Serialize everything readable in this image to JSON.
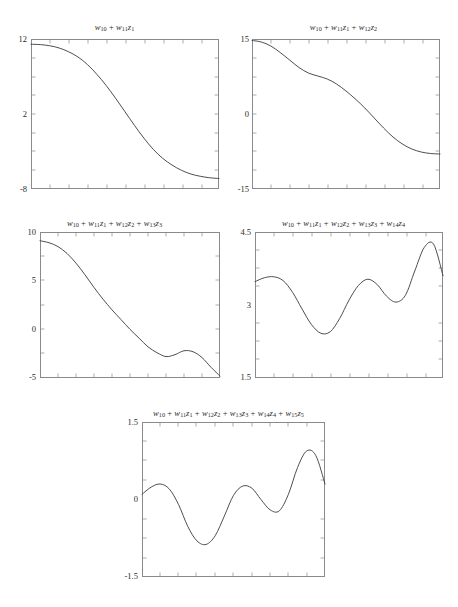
{
  "figure": {
    "background_color": "#ffffff",
    "line_color": "#3a3a3a",
    "axis_color": "#8a8a8a",
    "layout": "2-2-1 grid of line plots"
  },
  "chart_data": [
    {
      "type": "line",
      "id": "panel-1",
      "title": "w10 + w11z1",
      "title_parts": [
        {
          "sym": "w",
          "sub": "10"
        },
        {
          "op": "+"
        },
        {
          "sym": "w",
          "sub": "11"
        },
        {
          "sym": "z",
          "sub": "1"
        }
      ],
      "xlabel": "",
      "ylabel": "",
      "ylim": [
        -8,
        12
      ],
      "xlim": [
        0,
        1
      ],
      "yticks": [
        12,
        2,
        -8
      ],
      "ytick_labels": [
        "12",
        "2",
        "-8"
      ],
      "grid": false,
      "legend": "none",
      "x": [
        0.0,
        0.05,
        0.1,
        0.15,
        0.2,
        0.25,
        0.3,
        0.35,
        0.4,
        0.45,
        0.5,
        0.55,
        0.6,
        0.65,
        0.7,
        0.75,
        0.8,
        0.85,
        0.9,
        0.95,
        1.0
      ],
      "values": [
        11.3,
        11.25,
        11.1,
        10.8,
        10.3,
        9.6,
        8.6,
        7.3,
        5.8,
        4.1,
        2.3,
        0.5,
        -1.2,
        -2.7,
        -3.9,
        -4.8,
        -5.5,
        -6.0,
        -6.3,
        -6.5,
        -6.6
      ]
    },
    {
      "type": "line",
      "id": "panel-2",
      "title": "w10 + w11z1 + w12z2",
      "title_parts": [
        {
          "sym": "w",
          "sub": "10"
        },
        {
          "op": "+"
        },
        {
          "sym": "w",
          "sub": "11"
        },
        {
          "sym": "z",
          "sub": "1"
        },
        {
          "op": "+"
        },
        {
          "sym": "w",
          "sub": "12"
        },
        {
          "sym": "z",
          "sub": "2"
        }
      ],
      "xlabel": "",
      "ylabel": "",
      "ylim": [
        -15,
        15
      ],
      "xlim": [
        0,
        1
      ],
      "yticks": [
        15,
        0,
        -15
      ],
      "ytick_labels": [
        "15",
        "0",
        "-15"
      ],
      "grid": false,
      "legend": "none",
      "x": [
        0.0,
        0.05,
        0.1,
        0.15,
        0.2,
        0.25,
        0.3,
        0.35,
        0.4,
        0.45,
        0.5,
        0.55,
        0.6,
        0.65,
        0.7,
        0.75,
        0.8,
        0.85,
        0.9,
        0.95,
        1.0
      ],
      "values": [
        14.7,
        14.4,
        13.6,
        12.3,
        10.8,
        9.3,
        8.2,
        7.6,
        7.0,
        6.0,
        4.6,
        3.0,
        1.2,
        -0.8,
        -2.8,
        -4.6,
        -6.0,
        -7.0,
        -7.6,
        -7.9,
        -8.0
      ]
    },
    {
      "type": "line",
      "id": "panel-3",
      "title": "w10 + w11z1 + w12z2 + w13z3",
      "title_parts": [
        {
          "sym": "w",
          "sub": "10"
        },
        {
          "op": "+"
        },
        {
          "sym": "w",
          "sub": "11"
        },
        {
          "sym": "z",
          "sub": "1"
        },
        {
          "op": "+"
        },
        {
          "sym": "w",
          "sub": "12"
        },
        {
          "sym": "z",
          "sub": "2"
        },
        {
          "op": "+"
        },
        {
          "sym": "w",
          "sub": "13"
        },
        {
          "sym": "z",
          "sub": "3"
        }
      ],
      "xlabel": "",
      "ylabel": "",
      "ylim": [
        -5,
        10
      ],
      "xlim": [
        0,
        1
      ],
      "yticks": [
        10,
        5,
        0,
        -5
      ],
      "ytick_labels": [
        "10",
        "5",
        "0",
        "-5"
      ],
      "grid": false,
      "legend": "none",
      "x": [
        0.0,
        0.05,
        0.1,
        0.15,
        0.2,
        0.25,
        0.3,
        0.35,
        0.4,
        0.45,
        0.5,
        0.55,
        0.6,
        0.65,
        0.7,
        0.75,
        0.8,
        0.85,
        0.9,
        0.95,
        1.0
      ],
      "values": [
        9.1,
        8.9,
        8.5,
        7.8,
        6.8,
        5.6,
        4.3,
        3.1,
        2.0,
        1.0,
        0.0,
        -0.9,
        -1.8,
        -2.4,
        -2.8,
        -2.6,
        -2.2,
        -2.3,
        -2.9,
        -3.9,
        -4.8
      ]
    },
    {
      "type": "line",
      "id": "panel-4",
      "title": "w10 + w11z1 + w12z2 + w13z3 + w14z4",
      "title_parts": [
        {
          "sym": "w",
          "sub": "10"
        },
        {
          "op": "+"
        },
        {
          "sym": "w",
          "sub": "11"
        },
        {
          "sym": "z",
          "sub": "1"
        },
        {
          "op": "+"
        },
        {
          "sym": "w",
          "sub": "12"
        },
        {
          "sym": "z",
          "sub": "2"
        },
        {
          "op": "+"
        },
        {
          "sym": "w",
          "sub": "13"
        },
        {
          "sym": "z",
          "sub": "3"
        },
        {
          "op": "+"
        },
        {
          "sym": "w",
          "sub": "14"
        },
        {
          "sym": "z",
          "sub": "4"
        }
      ],
      "xlabel": "",
      "ylabel": "",
      "ylim": [
        1.5,
        4.5
      ],
      "xlim": [
        0,
        1
      ],
      "yticks": [
        4.5,
        3,
        1.5
      ],
      "ytick_labels": [
        "4.5",
        "3",
        "1.5"
      ],
      "grid": false,
      "legend": "none",
      "x": [
        0.0,
        0.05,
        0.1,
        0.15,
        0.2,
        0.25,
        0.3,
        0.35,
        0.4,
        0.45,
        0.5,
        0.55,
        0.6,
        0.65,
        0.7,
        0.75,
        0.8,
        0.85,
        0.9,
        0.95,
        1.0
      ],
      "values": [
        3.48,
        3.56,
        3.58,
        3.5,
        3.26,
        2.92,
        2.6,
        2.42,
        2.45,
        2.72,
        3.1,
        3.4,
        3.53,
        3.42,
        3.18,
        3.06,
        3.2,
        3.7,
        4.18,
        4.25,
        3.6
      ]
    },
    {
      "type": "line",
      "id": "panel-5",
      "title": "w10 + w11z1 + w12z2 + w13z3 + w14z4 + w15z5",
      "title_parts": [
        {
          "sym": "w",
          "sub": "10"
        },
        {
          "op": "+"
        },
        {
          "sym": "w",
          "sub": "11"
        },
        {
          "sym": "z",
          "sub": "1"
        },
        {
          "op": "+"
        },
        {
          "sym": "w",
          "sub": "12"
        },
        {
          "sym": "z",
          "sub": "2"
        },
        {
          "op": "+"
        },
        {
          "sym": "w",
          "sub": "13"
        },
        {
          "sym": "z",
          "sub": "3"
        },
        {
          "op": "+"
        },
        {
          "sym": "w",
          "sub": "14"
        },
        {
          "sym": "z",
          "sub": "4"
        },
        {
          "op": "+"
        },
        {
          "sym": "w",
          "sub": "15"
        },
        {
          "sym": "z",
          "sub": "5"
        }
      ],
      "xlabel": "",
      "ylabel": "",
      "ylim": [
        -1.5,
        1.5
      ],
      "xlim": [
        0,
        1
      ],
      "yticks": [
        1.5,
        0,
        -1.5
      ],
      "ytick_labels": [
        "1.5",
        "0",
        "-1.5"
      ],
      "grid": false,
      "legend": "none",
      "x": [
        0.0,
        0.05,
        0.1,
        0.15,
        0.2,
        0.25,
        0.3,
        0.35,
        0.4,
        0.45,
        0.5,
        0.55,
        0.6,
        0.65,
        0.7,
        0.75,
        0.8,
        0.85,
        0.9,
        0.95,
        1.0
      ],
      "values": [
        0.1,
        0.24,
        0.3,
        0.2,
        -0.1,
        -0.52,
        -0.8,
        -0.87,
        -0.7,
        -0.32,
        0.08,
        0.26,
        0.22,
        0.0,
        -0.2,
        -0.22,
        0.1,
        0.62,
        0.94,
        0.85,
        0.3
      ]
    }
  ]
}
